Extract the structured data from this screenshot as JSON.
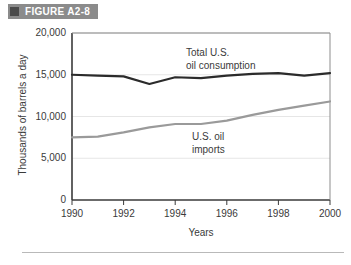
{
  "figure": {
    "marker": "square-marker-icon",
    "label": "FIGURE A2-8"
  },
  "chart_data": {
    "type": "line",
    "title": "FIGURE A2-8",
    "xlabel": "Years",
    "ylabel": "Thousands of barrels a day",
    "xlim": [
      1990,
      2000
    ],
    "ylim": [
      0,
      20000
    ],
    "grid": true,
    "legend_position": "inline-annotation",
    "x": [
      1990,
      1991,
      1992,
      1993,
      1994,
      1995,
      1996,
      1997,
      1998,
      1999,
      2000
    ],
    "xticks": [
      "1990",
      "1992",
      "1994",
      "1996",
      "1998",
      "2000"
    ],
    "xtick_values": [
      1990,
      1992,
      1994,
      1996,
      1998,
      2000
    ],
    "yticks": [
      "0",
      "5,000",
      "10,000",
      "15,000",
      "20,000"
    ],
    "ytick_values": [
      0,
      5000,
      10000,
      15000,
      20000
    ],
    "series": [
      {
        "name": "Total U.S. oil consumption",
        "label_line1": "Total U.S.",
        "label_line2": "oil consumption",
        "color": "#2b2b2b",
        "values": [
          15000,
          14900,
          14800,
          13900,
          14700,
          14600,
          14900,
          15100,
          15200,
          14900,
          15200
        ]
      },
      {
        "name": "U.S. oil imports",
        "label_line1": "U.S. oil",
        "label_line2": "imports",
        "color": "#9a9a9a",
        "values": [
          7500,
          7600,
          8100,
          8700,
          9100,
          9100,
          9500,
          10200,
          10800,
          11300,
          11800
        ]
      }
    ]
  },
  "axis": {
    "y_title": "Thousands of barrels a day",
    "x_title": "Years",
    "y_labels": {
      "t20000": "20,000",
      "t15000": "15,000",
      "t10000": "10,000",
      "t5000": "5,000",
      "t0": "0"
    },
    "x_labels": {
      "x1990": "1990",
      "x1992": "1992",
      "x1994": "1994",
      "x1996": "1996",
      "x1998": "1998",
      "x2000": "2000"
    }
  },
  "annotations": {
    "consumption_line1": "Total U.S.",
    "consumption_line2": "oil consumption",
    "imports_line1": "U.S. oil",
    "imports_line2": "imports"
  },
  "colors": {
    "consumption": "#2b2b2b",
    "imports": "#9a9a9a",
    "header_bg": "#8b8b8b",
    "header_marker": "#4a4a4a",
    "axis": "#3a3a3a",
    "grid": "#e2e2e2"
  }
}
